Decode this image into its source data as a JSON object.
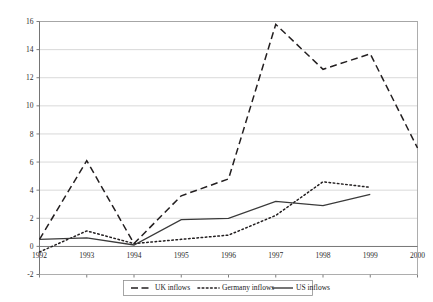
{
  "chart_data": {
    "type": "line",
    "title": "",
    "subtitle": "",
    "xlabel": "",
    "ylabel": "",
    "x": [
      1992,
      1993,
      1994,
      1995,
      1996,
      1997,
      1998,
      1999,
      2000
    ],
    "xticklabels": [
      "1992",
      "1993",
      "1994",
      "1995",
      "1996",
      "1997",
      "1998",
      "1999",
      "2000"
    ],
    "yticklabels": [
      "-2",
      "0",
      "2",
      "4",
      "6",
      "8",
      "10",
      "12",
      "14",
      "16"
    ],
    "ylim": [
      -2,
      16
    ],
    "ytick_step": 2,
    "xlim": [
      1992,
      2000
    ],
    "grid": "horizontal",
    "legend_position": "bottom-center",
    "series": [
      {
        "name": "UK inflows",
        "style": "dashed",
        "color": "#231f20",
        "x": [
          1992,
          1993,
          1994,
          1995,
          1996,
          1997,
          1998,
          1999,
          2000
        ],
        "values": [
          0.5,
          6.1,
          0.2,
          3.6,
          4.8,
          15.8,
          12.6,
          13.7,
          7.0
        ]
      },
      {
        "name": "Germany inflows",
        "style": "dotted",
        "color": "#231f20",
        "x": [
          1992,
          1993,
          1994,
          1995,
          1996,
          1997,
          1998,
          1999
        ],
        "values": [
          -0.4,
          1.1,
          0.2,
          0.5,
          0.8,
          2.2,
          4.6,
          4.2
        ]
      },
      {
        "name": "US inflows",
        "style": "solid",
        "color": "#3a3a3a",
        "x": [
          1992,
          1993,
          1994,
          1995,
          1996,
          1997,
          1998,
          1999
        ],
        "values": [
          0.5,
          0.6,
          0.1,
          1.9,
          2.0,
          3.2,
          2.9,
          3.7
        ]
      }
    ]
  },
  "legend": {
    "items": [
      {
        "label": "UK inflows",
        "swatch": "dashed-line-swatch"
      },
      {
        "label": "Germany inflows",
        "swatch": "dotted-line-swatch"
      },
      {
        "label": "US inflows",
        "swatch": "solid-line-swatch"
      }
    ]
  }
}
